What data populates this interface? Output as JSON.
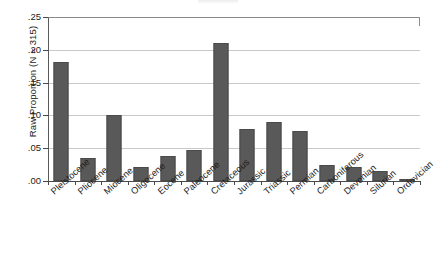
{
  "chart_data": {
    "type": "bar",
    "title": "",
    "xlabel": "",
    "ylabel": "Raw Proportion (N = 315)",
    "ylim": [
      0,
      0.25
    ],
    "ytick_labels": [
      ".00",
      ".05",
      ".10",
      ".15",
      ".20",
      ".25"
    ],
    "ytick_values": [
      0.0,
      0.05,
      0.1,
      0.15,
      0.2,
      0.25
    ],
    "grid": true,
    "legend": "none",
    "bar_color": "#595959",
    "categories": [
      "Pleistocene",
      "Pliocene",
      "Miocene",
      "Oligocene",
      "Eocene",
      "Paleocene",
      "Cretaceous",
      "Jurassic",
      "Triassic",
      "Permian",
      "Carboniferous",
      "Devonian",
      "Silurian",
      "Ordovician"
    ],
    "values": [
      0.181,
      0.035,
      0.101,
      0.022,
      0.038,
      0.047,
      0.211,
      0.079,
      0.09,
      0.077,
      0.025,
      0.021,
      0.016,
      0.003
    ]
  }
}
